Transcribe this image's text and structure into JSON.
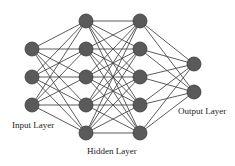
{
  "diagram": {
    "type": "neural-network",
    "colors": {
      "node_fill": "#5a5a5a",
      "node_stroke": "#3a3a3a",
      "edge": "#4a4a4a",
      "background": "#ffffff",
      "text": "#222222"
    },
    "node_radius": 7,
    "layers": [
      {
        "name": "input",
        "x": 32,
        "ys": [
          49,
          77,
          105
        ]
      },
      {
        "name": "hidden1",
        "x": 86,
        "ys": [
          21,
          49,
          77,
          105,
          133
        ]
      },
      {
        "name": "hidden2",
        "x": 140,
        "ys": [
          21,
          49,
          77,
          105,
          133
        ]
      },
      {
        "name": "output",
        "x": 194,
        "ys": [
          64,
          92
        ]
      }
    ],
    "labels": {
      "input": "Input Layer",
      "hidden": "Hidden Layer",
      "output": "Output Layer"
    }
  }
}
